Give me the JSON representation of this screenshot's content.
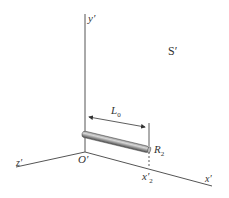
{
  "figure": {
    "frame_label": "S′",
    "axes": {
      "y": "y′",
      "z": "z′",
      "x": "x′",
      "origin": "O′"
    },
    "rod": {
      "length_label": "L",
      "length_sub": "0",
      "end_label": "R",
      "end_sub": "2",
      "end_coord": "x′",
      "end_coord_sub": "2"
    },
    "colors": {
      "axis": "#555555",
      "rod_light": "#c8c8c8",
      "rod_dark": "#555555"
    }
  }
}
